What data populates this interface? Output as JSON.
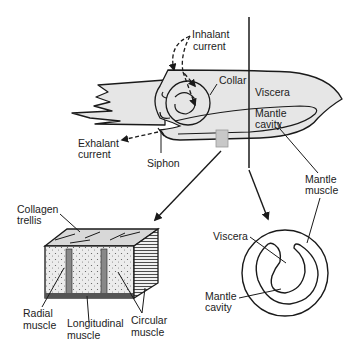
{
  "colors": {
    "fill": "#e6e6e6",
    "stroke": "#1a1a1a",
    "highlight": "#c8c8c8"
  },
  "labels": {
    "inhalant": [
      "Inhalant",
      "current"
    ],
    "collar": "Collar",
    "viscera_top": "Viscera",
    "mantle_cavity_top": [
      "Mantle",
      "cavity"
    ],
    "exhalant": [
      "Exhalant",
      "current"
    ],
    "siphon": "Siphon",
    "mantle_muscle": [
      "Mantle",
      "muscle"
    ],
    "collagen": [
      "Collagen",
      "trellis"
    ],
    "radial": [
      "Radial",
      "muscle"
    ],
    "longitudinal": [
      "Longitudinal",
      "muscle"
    ],
    "circular": [
      "Circular",
      "muscle"
    ],
    "viscera_cross": "Viscera",
    "mantle_cavity_cross": [
      "Mantle",
      "cavity"
    ]
  }
}
